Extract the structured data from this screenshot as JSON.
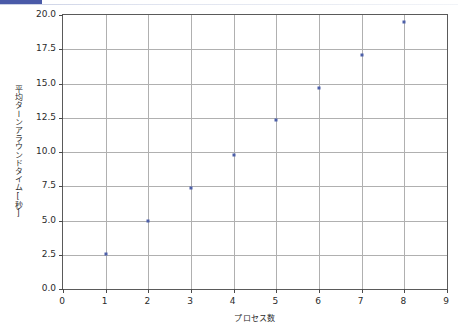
{
  "window": {
    "accent_color": "#4a5aa8",
    "rule_color": "#c9cfe4"
  },
  "chart_data": {
    "type": "scatter",
    "title": "",
    "xlabel": "プロセス数",
    "ylabel": "平均ターンアラウンドタイム[秒]",
    "xlim": [
      0,
      9
    ],
    "ylim": [
      0.0,
      20.0
    ],
    "xticks": [
      "0",
      "1",
      "2",
      "3",
      "4",
      "5",
      "6",
      "7",
      "8",
      "9"
    ],
    "xtick_values": [
      0,
      1,
      2,
      3,
      4,
      5,
      6,
      7,
      8,
      9
    ],
    "yticks": [
      "0.0",
      "2.5",
      "5.0",
      "7.5",
      "10.0",
      "12.5",
      "15.0",
      "17.5",
      "20.0"
    ],
    "ytick_values": [
      0.0,
      2.5,
      5.0,
      7.5,
      10.0,
      12.5,
      15.0,
      17.5,
      20.0
    ],
    "grid": true,
    "legend": null,
    "marker_color": "#4c5fa8",
    "series": [
      {
        "name": "平均ターンアラウンドタイム",
        "x": [
          1,
          2,
          3,
          4,
          5,
          6,
          7,
          8
        ],
        "y": [
          2.55,
          4.95,
          7.4,
          9.8,
          12.3,
          14.7,
          17.05,
          19.5
        ]
      }
    ]
  }
}
